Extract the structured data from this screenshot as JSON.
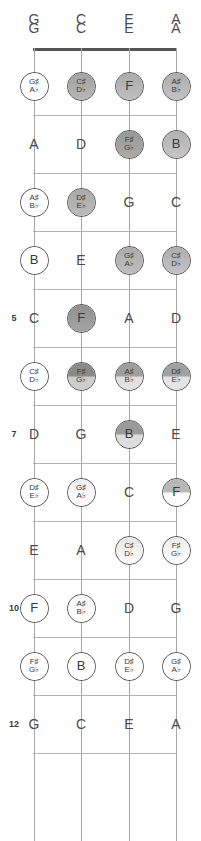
{
  "diagram": {
    "instrument": "ukulele",
    "tuning": [
      "G",
      "C",
      "E",
      "A"
    ],
    "fret_range": [
      0,
      12
    ],
    "marked_fret_numbers": [
      "5",
      "7",
      "10",
      "12"
    ],
    "colors": {
      "nut": "#555555",
      "fret_line": "#b4b4b4",
      "string_line": "#a8a8a8",
      "text": "#4a4a4a",
      "circle_outline": "#4a4a4a"
    }
  },
  "string_headers": [
    {
      "label": "G"
    },
    {
      "label": "C"
    },
    {
      "label": "E"
    },
    {
      "label": "A"
    }
  ],
  "fret_numbers": [
    {
      "fret": 5,
      "label": "5"
    },
    {
      "fret": 7,
      "label": "7"
    },
    {
      "fret": 10,
      "label": "10"
    },
    {
      "fret": 12,
      "label": "12"
    }
  ],
  "chart_data": {
    "type": "heatmap",
    "xlabel": "String",
    "ylabel": "Fret",
    "categories": [
      "G",
      "C",
      "E",
      "A"
    ],
    "x": [
      "G",
      "C",
      "E",
      "A"
    ],
    "y": [
      0,
      1,
      2,
      3,
      4,
      5,
      6,
      7,
      8,
      9,
      10,
      11,
      12
    ],
    "legend": "Circle shading = note emphasis (0 = none/plain, 1 = darkest)",
    "grid": true,
    "cells": [
      {
        "fret": 0,
        "string": "G",
        "note": "G",
        "sharp": "",
        "flat": "",
        "circled": false,
        "shade": 0.0,
        "split": false
      },
      {
        "fret": 0,
        "string": "C",
        "note": "C",
        "sharp": "",
        "flat": "",
        "circled": false,
        "shade": 0.0,
        "split": false
      },
      {
        "fret": 0,
        "string": "E",
        "note": "E",
        "sharp": "",
        "flat": "",
        "circled": false,
        "shade": 0.0,
        "split": false
      },
      {
        "fret": 0,
        "string": "A",
        "note": "A",
        "sharp": "",
        "flat": "",
        "circled": false,
        "shade": 0.0,
        "split": false
      },
      {
        "fret": 1,
        "string": "G",
        "note": "",
        "sharp": "G♯",
        "flat": "A♭",
        "circled": true,
        "shade": 0.0,
        "split": false
      },
      {
        "fret": 1,
        "string": "C",
        "note": "",
        "sharp": "C♯",
        "flat": "D♭",
        "circled": true,
        "shade": 0.55,
        "split": false
      },
      {
        "fret": 1,
        "string": "E",
        "note": "F",
        "sharp": "",
        "flat": "",
        "circled": true,
        "shade": 0.5,
        "split": false
      },
      {
        "fret": 1,
        "string": "A",
        "note": "",
        "sharp": "A♯",
        "flat": "B♭",
        "circled": true,
        "shade": 0.48,
        "split": false
      },
      {
        "fret": 2,
        "string": "G",
        "note": "A",
        "sharp": "",
        "flat": "",
        "circled": false,
        "shade": 0.0,
        "split": false
      },
      {
        "fret": 2,
        "string": "C",
        "note": "D",
        "sharp": "",
        "flat": "",
        "circled": false,
        "shade": 0.0,
        "split": false
      },
      {
        "fret": 2,
        "string": "E",
        "note": "",
        "sharp": "F♯",
        "flat": "G♭",
        "circled": true,
        "shade": 0.62,
        "split": false
      },
      {
        "fret": 2,
        "string": "A",
        "note": "B",
        "sharp": "",
        "flat": "",
        "circled": true,
        "shade": 0.46,
        "split": false
      },
      {
        "fret": 3,
        "string": "G",
        "note": "",
        "sharp": "A♯",
        "flat": "B♭",
        "circled": true,
        "shade": 0.0,
        "split": false
      },
      {
        "fret": 3,
        "string": "C",
        "note": "",
        "sharp": "D♯",
        "flat": "E♭",
        "circled": true,
        "shade": 0.52,
        "split": false
      },
      {
        "fret": 3,
        "string": "E",
        "note": "G",
        "sharp": "",
        "flat": "",
        "circled": false,
        "shade": 0.0,
        "split": false
      },
      {
        "fret": 3,
        "string": "A",
        "note": "C",
        "sharp": "",
        "flat": "",
        "circled": false,
        "shade": 0.0,
        "split": false
      },
      {
        "fret": 4,
        "string": "G",
        "note": "B",
        "sharp": "",
        "flat": "",
        "circled": true,
        "shade": 0.0,
        "split": false
      },
      {
        "fret": 4,
        "string": "C",
        "note": "E",
        "sharp": "",
        "flat": "",
        "circled": false,
        "shade": 0.0,
        "split": false
      },
      {
        "fret": 4,
        "string": "E",
        "note": "",
        "sharp": "G♯",
        "flat": "A♭",
        "circled": true,
        "shade": 0.5,
        "split": false
      },
      {
        "fret": 4,
        "string": "A",
        "note": "",
        "sharp": "C♯",
        "flat": "D♭",
        "circled": true,
        "shade": 0.48,
        "split": false
      },
      {
        "fret": 5,
        "string": "G",
        "note": "C",
        "sharp": "",
        "flat": "",
        "circled": false,
        "shade": 0.0,
        "split": false
      },
      {
        "fret": 5,
        "string": "C",
        "note": "F",
        "sharp": "",
        "flat": "",
        "circled": true,
        "shade": 0.66,
        "split": false
      },
      {
        "fret": 5,
        "string": "E",
        "note": "A",
        "sharp": "",
        "flat": "",
        "circled": false,
        "shade": 0.0,
        "split": false
      },
      {
        "fret": 5,
        "string": "A",
        "note": "D",
        "sharp": "",
        "flat": "",
        "circled": false,
        "shade": 0.0,
        "split": false
      },
      {
        "fret": 6,
        "string": "G",
        "note": "",
        "sharp": "C♯",
        "flat": "D♭",
        "circled": true,
        "shade": 0.0,
        "split": false
      },
      {
        "fret": 6,
        "string": "C",
        "note": "",
        "sharp": "F♯",
        "flat": "G♭",
        "circled": true,
        "shade": 0.7,
        "split": true
      },
      {
        "fret": 6,
        "string": "E",
        "note": "",
        "sharp": "A♯",
        "flat": "B♭",
        "circled": true,
        "shade": 0.58,
        "split": true
      },
      {
        "fret": 6,
        "string": "A",
        "note": "",
        "sharp": "D♯",
        "flat": "E♭",
        "circled": true,
        "shade": 0.56,
        "split": true
      },
      {
        "fret": 7,
        "string": "G",
        "note": "D",
        "sharp": "",
        "flat": "",
        "circled": false,
        "shade": 0.0,
        "split": false
      },
      {
        "fret": 7,
        "string": "C",
        "note": "G",
        "sharp": "",
        "flat": "",
        "circled": false,
        "shade": 0.0,
        "split": false
      },
      {
        "fret": 7,
        "string": "E",
        "note": "B",
        "sharp": "",
        "flat": "",
        "circled": true,
        "shade": 0.6,
        "split": true
      },
      {
        "fret": 7,
        "string": "A",
        "note": "E",
        "sharp": "",
        "flat": "",
        "circled": false,
        "shade": 0.0,
        "split": false
      },
      {
        "fret": 8,
        "string": "G",
        "note": "",
        "sharp": "D♯",
        "flat": "E♭",
        "circled": true,
        "shade": 0.0,
        "split": false
      },
      {
        "fret": 8,
        "string": "C",
        "note": "",
        "sharp": "G♯",
        "flat": "A♭",
        "circled": true,
        "shade": 0.1,
        "split": false
      },
      {
        "fret": 8,
        "string": "E",
        "note": "C",
        "sharp": "",
        "flat": "",
        "circled": false,
        "shade": 0.0,
        "split": false
      },
      {
        "fret": 8,
        "string": "A",
        "note": "F",
        "sharp": "",
        "flat": "",
        "circled": true,
        "shade": 0.42,
        "split": true
      },
      {
        "fret": 9,
        "string": "G",
        "note": "E",
        "sharp": "",
        "flat": "",
        "circled": false,
        "shade": 0.0,
        "split": false
      },
      {
        "fret": 9,
        "string": "C",
        "note": "A",
        "sharp": "",
        "flat": "",
        "circled": false,
        "shade": 0.0,
        "split": false
      },
      {
        "fret": 9,
        "string": "E",
        "note": "",
        "sharp": "C♯",
        "flat": "D♭",
        "circled": true,
        "shade": 0.14,
        "split": false
      },
      {
        "fret": 9,
        "string": "A",
        "note": "",
        "sharp": "F♯",
        "flat": "G♭",
        "circled": true,
        "shade": 0.12,
        "split": false
      },
      {
        "fret": 10,
        "string": "G",
        "note": "F",
        "sharp": "",
        "flat": "",
        "circled": true,
        "shade": 0.0,
        "split": false
      },
      {
        "fret": 10,
        "string": "C",
        "note": "",
        "sharp": "A♯",
        "flat": "B♭",
        "circled": true,
        "shade": 0.04,
        "split": false
      },
      {
        "fret": 10,
        "string": "E",
        "note": "D",
        "sharp": "",
        "flat": "",
        "circled": false,
        "shade": 0.0,
        "split": false
      },
      {
        "fret": 10,
        "string": "A",
        "note": "G",
        "sharp": "",
        "flat": "",
        "circled": false,
        "shade": 0.0,
        "split": false
      },
      {
        "fret": 11,
        "string": "G",
        "note": "",
        "sharp": "F♯",
        "flat": "G♭",
        "circled": true,
        "shade": 0.0,
        "split": false
      },
      {
        "fret": 11,
        "string": "C",
        "note": "B",
        "sharp": "",
        "flat": "",
        "circled": true,
        "shade": 0.0,
        "split": false
      },
      {
        "fret": 11,
        "string": "E",
        "note": "",
        "sharp": "D♯",
        "flat": "E♭",
        "circled": true,
        "shade": 0.0,
        "split": false
      },
      {
        "fret": 11,
        "string": "A",
        "note": "",
        "sharp": "G♯",
        "flat": "A♭",
        "circled": true,
        "shade": 0.0,
        "split": false
      },
      {
        "fret": 12,
        "string": "G",
        "note": "G",
        "sharp": "",
        "flat": "",
        "circled": false,
        "shade": 0.0,
        "split": false
      },
      {
        "fret": 12,
        "string": "C",
        "note": "C",
        "sharp": "",
        "flat": "",
        "circled": false,
        "shade": 0.0,
        "split": false
      },
      {
        "fret": 12,
        "string": "E",
        "note": "E",
        "sharp": "",
        "flat": "",
        "circled": false,
        "shade": 0.0,
        "split": false
      },
      {
        "fret": 12,
        "string": "A",
        "note": "A",
        "sharp": "",
        "flat": "",
        "circled": false,
        "shade": 0.0,
        "split": false
      }
    ]
  },
  "geometry": {
    "string_x": [
      34,
      81,
      129,
      176
    ],
    "fret_y": [
      48,
      115,
      173,
      231,
      289,
      347,
      405,
      463,
      521,
      579,
      637,
      695,
      753
    ],
    "header_y": 28,
    "cell_offset": -29,
    "nut_x1": 33,
    "nut_x2": 177,
    "bottom_y": 841,
    "fret_num_x": 14
  }
}
